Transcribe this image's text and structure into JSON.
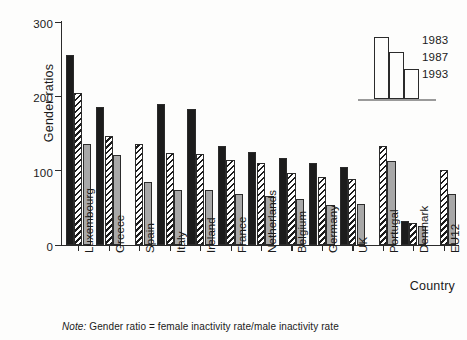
{
  "chart_data": {
    "type": "bar",
    "title": "",
    "xlabel": "Country",
    "ylabel": "Gender ratios",
    "ylim": [
      0,
      300
    ],
    "yticks": [
      0,
      100,
      200,
      300
    ],
    "grid": false,
    "legend_position": "top-right",
    "categories": [
      "Luxembourg",
      "Greece",
      "Spain",
      "Italy",
      "Ireland",
      "France",
      "Netherlands",
      "Belgium",
      "Germany",
      "UK",
      "Portugal",
      "Denmark",
      "EU12"
    ],
    "series": [
      {
        "name": "1983",
        "color": "#1c1c1c",
        "pattern": "solid",
        "values": [
          255,
          185,
          null,
          190,
          183,
          133,
          125,
          117,
          110,
          105,
          null,
          32,
          null
        ]
      },
      {
        "name": "1987",
        "color": "#ffffff",
        "pattern": "diagonal-hatch",
        "values": [
          204,
          146,
          136,
          124,
          123,
          115,
          110,
          97,
          92,
          89,
          133,
          29,
          101
        ]
      },
      {
        "name": "1993",
        "color": "#a8a8a8",
        "pattern": "solid",
        "values": [
          136,
          121,
          85,
          74,
          74,
          68,
          66,
          62,
          54,
          55,
          113,
          25,
          68
        ]
      }
    ],
    "footnote_label": "Note:",
    "footnote_text": " Gender ratio = female inactivity rate/male inactivity rate"
  },
  "axis": {
    "y_title": "Gender ratios",
    "x_title": "Country",
    "y_tick_labels": [
      "300",
      "200",
      "100",
      "0"
    ]
  },
  "legend": {
    "entries": [
      {
        "label": "1983"
      },
      {
        "label": "1987"
      },
      {
        "label": "1993"
      }
    ]
  }
}
